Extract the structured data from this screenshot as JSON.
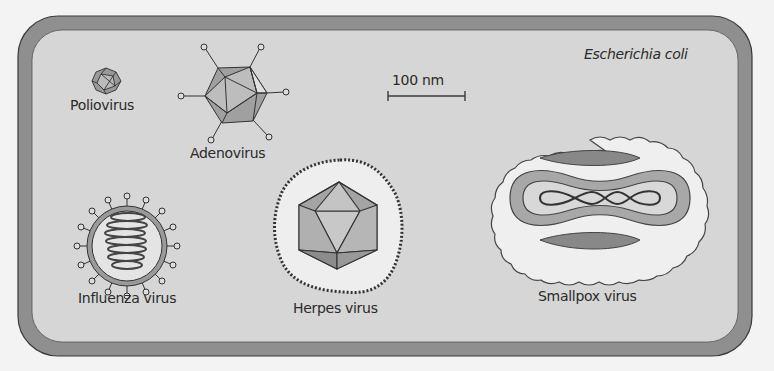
{
  "figure": {
    "container_label": "Escherichia coli",
    "scale_bar": {
      "label": "100 nm"
    },
    "viruses": [
      {
        "name": "Poliovirus",
        "shape": "small icosahedron"
      },
      {
        "name": "Adenovirus",
        "shape": "icosahedron with fibers"
      },
      {
        "name": "Influenza virus",
        "shape": "spherical envelope with spikes and helical nucleocapsid"
      },
      {
        "name": "Herpes virus",
        "shape": "icosahedral capsid inside envelope"
      },
      {
        "name": "Smallpox virus",
        "shape": "oval brick with dumbbell core and lateral bodies"
      }
    ]
  },
  "colors": {
    "cell_wall": "#8f8f8f",
    "cell_interior": "#d6d6d6",
    "outline": "#3a3a3a",
    "light_fill": "#eeeeee",
    "mid_fill": "#a9a9a9",
    "dark_fill": "#858585"
  }
}
